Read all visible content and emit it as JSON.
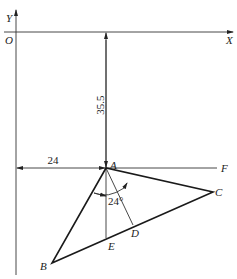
{
  "diagram": {
    "type": "geometry-coordinate-drawing",
    "axes": {
      "origin_label": "O",
      "x_label": "X",
      "y_label": "Y"
    },
    "points": {
      "A": "A",
      "B": "B",
      "C": "C",
      "D": "D",
      "E": "E",
      "F": "F"
    },
    "dimensions": {
      "vertical": "35.5",
      "horizontal": "24",
      "angle": "24°"
    },
    "colors": {
      "line": "#1a1a1a",
      "background": "#ffffff"
    }
  }
}
